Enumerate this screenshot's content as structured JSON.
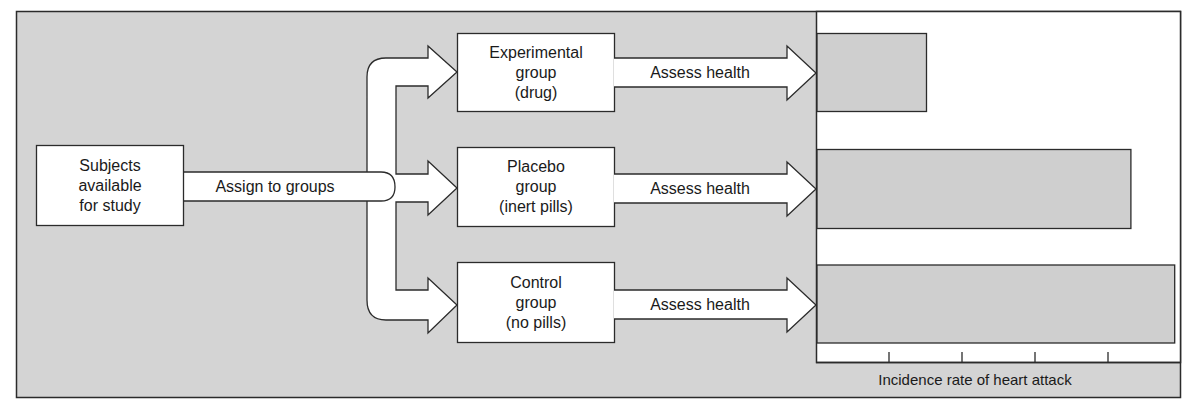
{
  "colors": {
    "background_gray": "#d4d4d4",
    "box_fill": "#ffffff",
    "bar_fill": "#cfcfcf",
    "stroke": "#2b2b2b",
    "chart_fill": "#ffffff"
  },
  "source_box": {
    "lines": [
      "Subjects",
      "available",
      "for study"
    ]
  },
  "assign_arrow": {
    "label": "Assign to groups"
  },
  "groups": [
    {
      "id": "experimental",
      "lines": [
        "Experimental",
        "group",
        "(drug)"
      ],
      "assess_label": "Assess health"
    },
    {
      "id": "placebo",
      "lines": [
        "Placebo",
        "group",
        "(inert pills)"
      ],
      "assess_label": "Assess health"
    },
    {
      "id": "control",
      "lines": [
        "Control",
        "group",
        "(no pills)"
      ],
      "assess_label": "Assess health"
    }
  ],
  "chart_data": {
    "type": "bar",
    "orientation": "horizontal",
    "categories": [
      "Experimental group (drug)",
      "Placebo group (inert pills)",
      "Control group (no pills)"
    ],
    "values": [
      1.5,
      4.3,
      4.9
    ],
    "title": "",
    "xlabel": "Incidence rate of heart attack",
    "ylabel": "",
    "xlim": [
      0,
      5.0
    ],
    "x_ticks": [
      1,
      2,
      3,
      4
    ],
    "tick_labels_shown": false,
    "grid": false,
    "legend": "none"
  }
}
